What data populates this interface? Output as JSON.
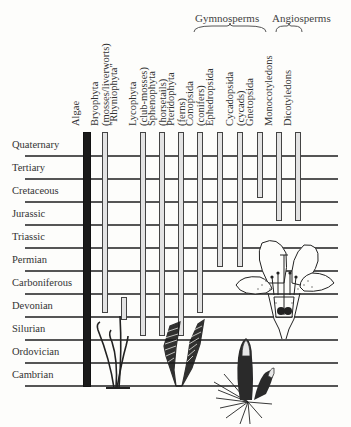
{
  "groups": {
    "gymnosperms": "Gymnosperms",
    "angiosperms": "Angiosperms"
  },
  "columns": [
    {
      "id": "algae",
      "label": "Algae",
      "sub": "",
      "x": 83,
      "w": 8,
      "solid": true,
      "start": "Cambrian",
      "end": "Quaternary"
    },
    {
      "id": "bryophyta",
      "label": "Bryophyta",
      "sub": "(mosses/liverworts)",
      "x": 102,
      "w": 6,
      "start": "Carboniferous",
      "end": "Quaternary"
    },
    {
      "id": "rhyniophyta",
      "label": "\"Rhyniophyta\"",
      "sub": "",
      "x": 121,
      "w": 6,
      "start": "Devonian",
      "end": "Devonian"
    },
    {
      "id": "lycophyta",
      "label": "Lycophyta",
      "sub": "(club-mosses)",
      "x": 140,
      "w": 6,
      "start": "Devonian",
      "end": "Quaternary"
    },
    {
      "id": "sphenophyta",
      "label": "Sphenophyta",
      "sub": "(horsetails)",
      "x": 159,
      "w": 6,
      "start": "Devonian",
      "end": "Quaternary"
    },
    {
      "id": "pteridophyta",
      "label": "Pteridophyta",
      "sub": "(ferns)",
      "x": 178,
      "w": 6,
      "start": "Devonian",
      "end": "Quaternary"
    },
    {
      "id": "conopsida",
      "label": "Conopsida",
      "sub": "(conifers)",
      "x": 197,
      "w": 6,
      "start": "Carboniferous",
      "end": "Quaternary"
    },
    {
      "id": "ephedropsida",
      "label": "Ephedropsida",
      "sub": "",
      "x": 217,
      "w": 6,
      "start": "Triassic",
      "end": "Quaternary"
    },
    {
      "id": "cycadopsida",
      "label": "Cycadopsida",
      "sub": "(cycads)",
      "x": 237,
      "w": 6,
      "start": "Triassic",
      "end": "Quaternary"
    },
    {
      "id": "gnetopsida",
      "label": "Gnetopsida",
      "sub": "",
      "x": 257,
      "w": 6,
      "start": "Tertiary",
      "end": "Quaternary"
    },
    {
      "id": "monocotyledons",
      "label": "Monocotyledons",
      "sub": "",
      "x": 276,
      "w": 6,
      "start": "Cretaceous",
      "end": "Quaternary"
    },
    {
      "id": "dicotyledons",
      "label": "Dicotyledons",
      "sub": "",
      "x": 295,
      "w": 6,
      "start": "Cretaceous",
      "end": "Quaternary"
    }
  ],
  "periods": [
    {
      "label": "Quaternary",
      "y": 155
    },
    {
      "label": "Tertiary",
      "y": 178
    },
    {
      "label": "Cretaceous",
      "y": 201
    },
    {
      "label": "Jurassic",
      "y": 224
    },
    {
      "label": "Triassic",
      "y": 247
    },
    {
      "label": "Permian",
      "y": 270
    },
    {
      "label": "Carboniferous",
      "y": 293
    },
    {
      "label": "Devonian",
      "y": 316
    },
    {
      "label": "Silurian",
      "y": 339
    },
    {
      "label": "Ordovician",
      "y": 362
    },
    {
      "label": "Cambrian",
      "y": 385
    }
  ],
  "illustrations": [
    "rhynia-plant",
    "fern-frond",
    "club-moss-cone",
    "flower-section"
  ]
}
